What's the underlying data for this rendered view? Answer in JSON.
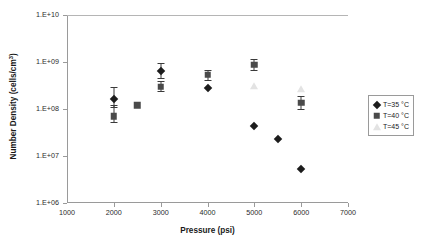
{
  "chart_data": {
    "type": "scatter",
    "title": "",
    "xlabel": "Pressure (psi)",
    "ylabel": "Number Density (cells/cm3)",
    "ylabel_base": "Number Density (cells/cm",
    "ylabel_sup": "3",
    "ylabel_tail": ")",
    "xlim": [
      1000,
      7000
    ],
    "ylim": [
      1000000,
      10000000000
    ],
    "yscale": "log",
    "xscale": "linear",
    "grid": false,
    "legend_position": "right",
    "xticks": [
      1000,
      2000,
      3000,
      4000,
      5000,
      6000,
      7000
    ],
    "xtick_labels": [
      "1000",
      "2000",
      "3000",
      "4000",
      "5000",
      "6000",
      "7000"
    ],
    "yticks": [
      1000000,
      10000000,
      100000000,
      1000000000,
      10000000000
    ],
    "ytick_labels": [
      "1.E+06",
      "1.E+07",
      "1.E+08",
      "1.E+09",
      "1.E+10"
    ],
    "series": [
      {
        "name": "T=35 °C",
        "marker": "diamond",
        "color": "#1c1c1c",
        "points": [
          {
            "x": 2000,
            "y": 160000000.0,
            "yerr_low": 110000000.0,
            "yerr_high": 290000000.0
          },
          {
            "x": 3000,
            "y": 640000000.0,
            "yerr_low": 460000000.0,
            "yerr_high": 940000000.0
          },
          {
            "x": 4000,
            "y": 280000000.0,
            "yerr_low": 280000000.0,
            "yerr_high": 280000000.0
          },
          {
            "x": 5000,
            "y": 44000000.0,
            "yerr_low": 44000000.0,
            "yerr_high": 44000000.0
          },
          {
            "x": 5500,
            "y": 23000000.0,
            "yerr_low": 23000000.0,
            "yerr_high": 23000000.0
          },
          {
            "x": 6000,
            "y": 5200000.0,
            "yerr_low": 5200000.0,
            "yerr_high": 5200000.0
          }
        ]
      },
      {
        "name": "T=40 °C",
        "marker": "square",
        "color": "#4a4a4a",
        "points": [
          {
            "x": 2000,
            "y": 70000000.0,
            "yerr_low": 54000000.0,
            "yerr_high": 120000000.0
          },
          {
            "x": 2500,
            "y": 120000000.0,
            "yerr_low": 120000000.0,
            "yerr_high": 120000000.0
          },
          {
            "x": 3000,
            "y": 300000000.0,
            "yerr_low": 240000000.0,
            "yerr_high": 390000000.0
          },
          {
            "x": 4000,
            "y": 530000000.0,
            "yerr_low": 420000000.0,
            "yerr_high": 680000000.0
          },
          {
            "x": 5000,
            "y": 870000000.0,
            "yerr_low": 680000000.0,
            "yerr_high": 1150000000.0
          },
          {
            "x": 6000,
            "y": 135000000.0,
            "yerr_low": 100000000.0,
            "yerr_high": 190000000.0
          }
        ]
      },
      {
        "name": "T=45 °C",
        "marker": "triangle",
        "color": "#e3e3e3",
        "points": [
          {
            "x": 5000,
            "y": 310000000.0,
            "yerr_low": 310000000.0,
            "yerr_high": 310000000.0
          },
          {
            "x": 6000,
            "y": 260000000.0,
            "yerr_low": 260000000.0,
            "yerr_high": 260000000.0
          }
        ]
      }
    ],
    "legend": [
      {
        "label": "T=35 °C",
        "marker": "diamond",
        "color": "#1c1c1c"
      },
      {
        "label": "T=40 °C",
        "marker": "square",
        "color": "#4a4a4a"
      },
      {
        "label": "T=45 °C",
        "marker": "triangle",
        "color": "#e3e3e3"
      }
    ]
  }
}
